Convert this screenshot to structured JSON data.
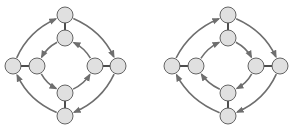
{
  "colors": {
    "background": "#ffffff",
    "node_fill": "#e0e0e0",
    "node_stroke": "#555555",
    "spoke": "#222222",
    "arc": "#6e6e6e"
  },
  "node_radius": 8,
  "diagrams": [
    {
      "id": "left",
      "nodes": {
        "top_outer": [
          65,
          15
        ],
        "top_inner": [
          65,
          38
        ],
        "left_outer": [
          13,
          66
        ],
        "left_inner": [
          37,
          66
        ],
        "right_inner": [
          95,
          66
        ],
        "right_outer": [
          118,
          66
        ],
        "bottom_inner": [
          65,
          93
        ],
        "bottom_outer": [
          65,
          116
        ]
      },
      "outer_ring_direction": "clockwise",
      "inner_ring_direction": "counterclockwise"
    },
    {
      "id": "right",
      "nodes": {
        "top_outer": [
          228,
          15
        ],
        "top_inner": [
          228,
          38
        ],
        "left_outer": [
          172,
          66
        ],
        "left_inner": [
          196,
          66
        ],
        "right_inner": [
          256,
          66
        ],
        "right_outer": [
          280,
          66
        ],
        "bottom_inner": [
          228,
          93
        ],
        "bottom_outer": [
          228,
          116
        ]
      },
      "outer_ring_direction": "clockwise",
      "inner_ring_direction": "clockwise"
    }
  ]
}
